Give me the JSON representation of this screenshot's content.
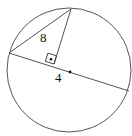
{
  "diagram": {
    "type": "geometry",
    "colors": {
      "stroke": "#555555",
      "text": "#111111",
      "background": "#ffffff"
    },
    "circle": {
      "cx": 69,
      "cy": 70,
      "r": 62
    },
    "points": {
      "top": {
        "x": 71,
        "y": 9
      },
      "left": {
        "x": 9,
        "y": 53
      },
      "chord_right": {
        "x": 129,
        "y": 91
      },
      "foot": {
        "x": 54,
        "y": 64
      },
      "center": {
        "x": 70,
        "y": 72
      }
    },
    "labels": {
      "hypotenuse": "8",
      "segment": "4"
    }
  }
}
